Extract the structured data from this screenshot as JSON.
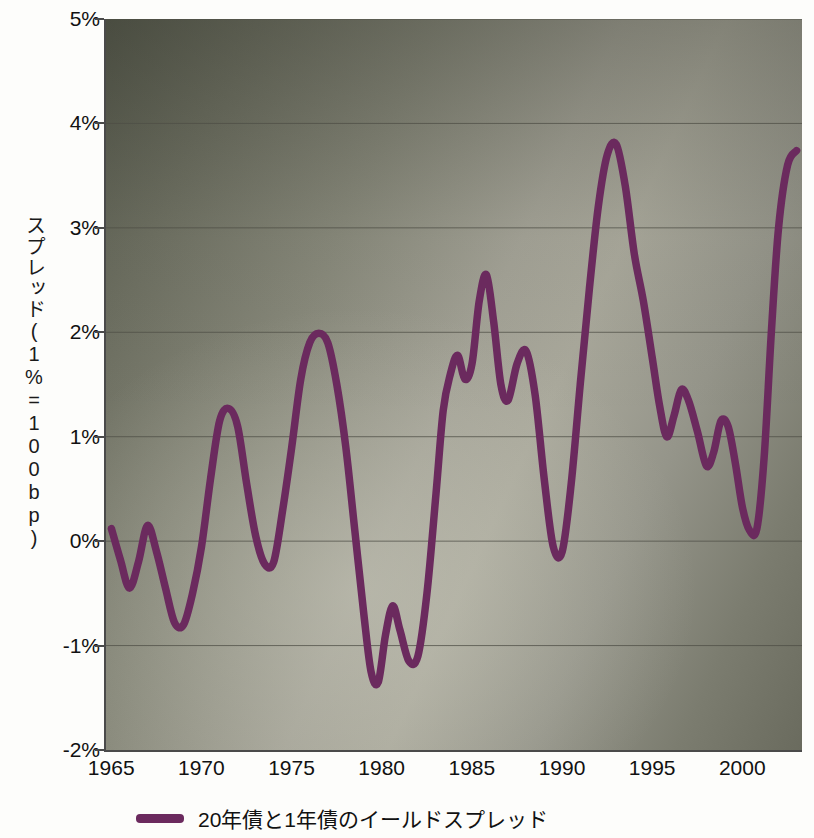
{
  "chart_data": {
    "type": "line",
    "title": "",
    "subtitle": "",
    "xlabel": "",
    "ylabel": "スプレッド(1%=100bp)",
    "xlim": [
      1964.6,
      2003.2
    ],
    "ylim": [
      -2,
      5
    ],
    "grid": true,
    "legend_position": "bottom",
    "y_tick_labels": [
      "5%",
      "4%",
      "3%",
      "2%",
      "1%",
      "0%",
      "-1%",
      "-2%"
    ],
    "y_tick_values": [
      5,
      4,
      3,
      2,
      1,
      0,
      -1,
      -2
    ],
    "x_tick_labels": [
      "1965",
      "1970",
      "1975",
      "1980",
      "1985",
      "1990",
      "1995",
      "2000"
    ],
    "x_tick_values": [
      1965,
      1970,
      1975,
      1980,
      1985,
      1990,
      1995,
      2000
    ],
    "series": [
      {
        "name": "20年債と1年債のイールドスプレッド",
        "color": "#6b2a5e",
        "x": [
          1964.9,
          1965.4,
          1965.9,
          1966.4,
          1966.9,
          1967.4,
          1967.9,
          1968.4,
          1968.9,
          1969.4,
          1969.9,
          1970.4,
          1970.9,
          1971.4,
          1971.9,
          1972.4,
          1972.9,
          1973.4,
          1973.9,
          1974.4,
          1974.9,
          1975.4,
          1975.9,
          1976.4,
          1976.9,
          1977.4,
          1977.9,
          1978.4,
          1978.9,
          1979.3,
          1979.7,
          1980.1,
          1980.5,
          1980.9,
          1981.4,
          1981.9,
          1982.4,
          1982.9,
          1983.3,
          1983.7,
          1984.1,
          1984.5,
          1984.9,
          1985.3,
          1985.7,
          1986.1,
          1986.5,
          1986.9,
          1987.4,
          1987.9,
          1988.4,
          1988.9,
          1989.4,
          1989.9,
          1990.4,
          1990.9,
          1991.4,
          1991.9,
          1992.4,
          1992.9,
          1993.4,
          1993.9,
          1994.4,
          1994.9,
          1995.3,
          1995.7,
          1996.1,
          1996.5,
          1996.9,
          1997.4,
          1997.9,
          1998.3,
          1998.7,
          1999.1,
          1999.5,
          1999.9,
          2000.3,
          2000.7,
          2001.1,
          2001.5,
          2001.9,
          2002.4,
          2002.9
        ],
        "y": [
          0.12,
          -0.18,
          -0.45,
          -0.2,
          0.15,
          -0.1,
          -0.45,
          -0.78,
          -0.8,
          -0.5,
          -0.05,
          0.6,
          1.15,
          1.27,
          1.1,
          0.55,
          0.05,
          -0.22,
          -0.2,
          0.3,
          0.9,
          1.55,
          1.9,
          1.99,
          1.9,
          1.5,
          0.9,
          0.1,
          -0.7,
          -1.25,
          -1.35,
          -0.9,
          -0.62,
          -0.85,
          -1.15,
          -1.1,
          -0.5,
          0.45,
          1.25,
          1.6,
          1.78,
          1.55,
          1.7,
          2.3,
          2.55,
          2.1,
          1.5,
          1.35,
          1.7,
          1.82,
          1.4,
          0.6,
          -0.05,
          -0.1,
          0.55,
          1.5,
          2.4,
          3.2,
          3.7,
          3.8,
          3.4,
          2.75,
          2.3,
          1.75,
          1.3,
          1.0,
          1.2,
          1.45,
          1.35,
          1.05,
          0.72,
          0.85,
          1.15,
          1.1,
          0.75,
          0.32,
          0.1,
          0.12,
          0.8,
          2.0,
          3.0,
          3.6,
          3.74
        ]
      }
    ],
    "legend": [
      {
        "label": "20年債と1年債のイールドスプレッド",
        "color": "#6b2a5e"
      }
    ]
  },
  "colors": {
    "series_line": "#6b2a5e",
    "axis": "#4a4a4a",
    "gridline": "#4e4e46",
    "plot_bg_dark": "#585b4e",
    "plot_bg_light": "#a9a89b",
    "text": "#111111",
    "page_bg": "#fdfdfb"
  }
}
